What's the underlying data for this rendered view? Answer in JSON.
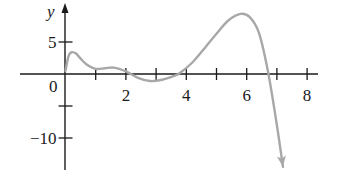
{
  "chart_data": {
    "type": "line",
    "title": "",
    "xlabel": "",
    "ylabel": "y",
    "xlim": [
      -1.5,
      8.4
    ],
    "ylim": [
      -15,
      11
    ],
    "grid": false,
    "legend": null,
    "x_tick_labels": [
      "0",
      "2",
      "4",
      "6",
      "8"
    ],
    "x_ticks": [
      1,
      2,
      3,
      4,
      5,
      6,
      7,
      8
    ],
    "y_tick_labels": [
      "5",
      "-10"
    ],
    "y_ticks": [
      5,
      -5,
      -10
    ],
    "origin_label": "0",
    "series": [
      {
        "name": "curve",
        "color": "#a8a8a8",
        "end_arrow": true,
        "x": [
          0.0,
          0.1,
          0.2,
          0.35,
          0.5,
          0.7,
          1.0,
          1.3,
          1.6,
          2.0,
          2.4,
          2.8,
          3.2,
          3.6,
          3.8,
          4.2,
          4.6,
          5.0,
          5.4,
          5.8,
          6.1,
          6.4,
          6.7,
          7.0,
          7.2
        ],
        "y": [
          0.5,
          2.8,
          3.4,
          3.2,
          2.4,
          1.5,
          0.8,
          0.9,
          1.0,
          0.4,
          -0.6,
          -1.1,
          -0.9,
          -0.3,
          0.2,
          1.8,
          4.0,
          6.3,
          8.4,
          9.4,
          8.9,
          6.5,
          0.5,
          -8.0,
          -14.5
        ]
      }
    ]
  },
  "axes": {
    "y_label": "y",
    "origin": "0",
    "x_labels": [
      {
        "text": "2",
        "x": 2
      },
      {
        "text": "4",
        "x": 4
      },
      {
        "text": "6",
        "x": 6
      },
      {
        "text": "8",
        "x": 8
      }
    ],
    "y_labels": [
      {
        "text": "5",
        "y": 5
      },
      {
        "text": "−10",
        "y": -10
      }
    ]
  }
}
